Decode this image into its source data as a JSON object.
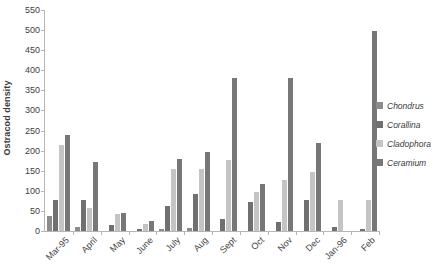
{
  "chart_data": {
    "type": "bar",
    "title": "",
    "xlabel": "",
    "ylabel": "Ostracod density",
    "ylim": [
      0,
      550
    ],
    "ytick_step": 50,
    "yticks": [
      0,
      50,
      100,
      150,
      200,
      250,
      300,
      350,
      400,
      450,
      500,
      550
    ],
    "grid": false,
    "legend_position": "right",
    "categories": [
      "Mar-95",
      "April",
      "May",
      "June",
      "July",
      "Aug",
      "Sept",
      "Oct",
      "Nov",
      "Dec",
      "Jan-96",
      "Feb"
    ],
    "series": [
      {
        "name": "Chondrus",
        "color": "#8c8c8c",
        "values": [
          38,
          10,
          0,
          0,
          5,
          8,
          0,
          0,
          0,
          0,
          0,
          0
        ]
      },
      {
        "name": "Corallina",
        "color": "#707070",
        "values": [
          78,
          78,
          16,
          4,
          62,
          92,
          30,
          72,
          22,
          76,
          10,
          5
        ]
      },
      {
        "name": "Cladophora",
        "color": "#c4c4c4",
        "values": [
          215,
          58,
          42,
          17,
          155,
          155,
          176,
          96,
          128,
          148,
          78,
          78
        ]
      },
      {
        "name": "Ceramium",
        "color": "#777777",
        "values": [
          238,
          173,
          44,
          26,
          180,
          196,
          380,
          118,
          380,
          220,
          0,
          498
        ]
      }
    ]
  },
  "legend": {
    "items": [
      {
        "label": "Chondrus"
      },
      {
        "label": "Corallina"
      },
      {
        "label": "Cladophora"
      },
      {
        "label": "Ceramium"
      }
    ]
  }
}
